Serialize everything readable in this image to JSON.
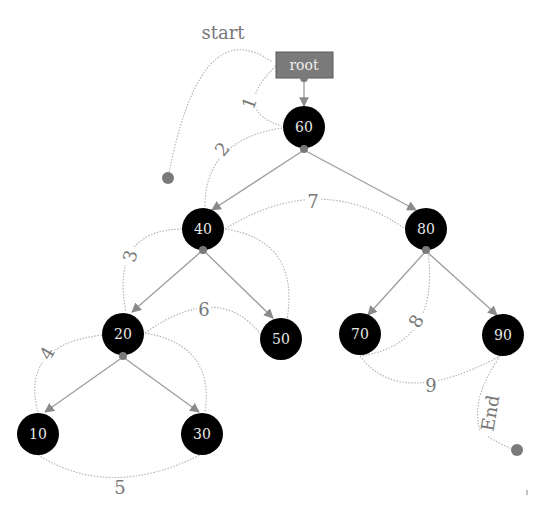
{
  "diagram": {
    "root_label": "root",
    "start_label": "start",
    "end_label": "End",
    "nodes": [
      {
        "id": "60",
        "label": "60"
      },
      {
        "id": "40",
        "label": "40"
      },
      {
        "id": "80",
        "label": "80"
      },
      {
        "id": "20",
        "label": "20"
      },
      {
        "id": "50",
        "label": "50"
      },
      {
        "id": "70",
        "label": "70"
      },
      {
        "id": "90",
        "label": "90"
      },
      {
        "id": "10",
        "label": "10"
      },
      {
        "id": "30",
        "label": "30"
      }
    ],
    "tree_edges": [
      [
        "root",
        "60"
      ],
      [
        "60",
        "40"
      ],
      [
        "60",
        "80"
      ],
      [
        "40",
        "20"
      ],
      [
        "40",
        "50"
      ],
      [
        "80",
        "70"
      ],
      [
        "80",
        "90"
      ],
      [
        "20",
        "10"
      ],
      [
        "20",
        "30"
      ]
    ],
    "traversal_steps": [
      {
        "label": "1",
        "from": "root",
        "to": "60"
      },
      {
        "label": "2",
        "from": "60",
        "to": "40"
      },
      {
        "label": "3",
        "from": "40",
        "to": "20"
      },
      {
        "label": "4",
        "from": "20",
        "to": "10"
      },
      {
        "label": "5",
        "from": "10",
        "to": "30"
      },
      {
        "label": "6",
        "from": "20",
        "to": "50"
      },
      {
        "label": "7",
        "from": "40",
        "to": "80"
      },
      {
        "label": "8",
        "from": "80",
        "to": "70"
      },
      {
        "label": "9",
        "from": "70",
        "to": "90"
      }
    ],
    "colors": {
      "node_fill": "#000000",
      "node_text": "#e8e8e8",
      "root_fill": "#7a7a7a",
      "edge": "#a0a0a0",
      "label": "#777777"
    }
  }
}
